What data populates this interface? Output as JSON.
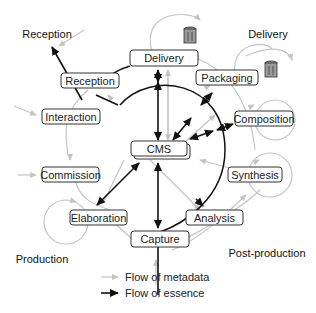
{
  "colors": {
    "metadata_flow": "#c4c4c4",
    "essence_flow": "#111111",
    "node_border": "#333333",
    "background": "#ffffff"
  },
  "regions": {
    "reception": "Reception",
    "delivery": "Delivery",
    "production": "Production",
    "post_production": "Post-production"
  },
  "nodes": {
    "delivery": "Delivery",
    "reception": "Reception",
    "packaging": "Packaging",
    "interaction": "Interaction",
    "composition": "Composition",
    "cms": "CMS",
    "commission": "Commission",
    "synthesis": "Synthesis",
    "elaboration": "Elaboration",
    "analysis": "Analysis",
    "capture": "Capture"
  },
  "icons": {
    "storage_1": "trash-bin-icon",
    "storage_2": "trash-bin-icon"
  },
  "legend": {
    "metadata": "Flow of metadata",
    "essence": "Flow of essence"
  }
}
